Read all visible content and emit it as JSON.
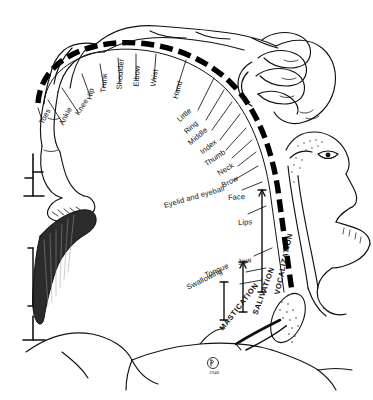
{
  "figure": {
    "background_color": "#ffffff",
    "ink_color": "#111111",
    "signature": {
      "monogram": "Ⓟ",
      "year": "1948"
    }
  },
  "body_labels": [
    {
      "id": "toes",
      "text": "Toes"
    },
    {
      "id": "ankle",
      "text": "Ankle"
    },
    {
      "id": "knee",
      "text": "Knee"
    },
    {
      "id": "hip",
      "text": "Hip"
    },
    {
      "id": "trunk",
      "text": "Trunk"
    },
    {
      "id": "shoulder",
      "text": "Shoulder"
    },
    {
      "id": "elbow",
      "text": "Elbow"
    },
    {
      "id": "wrist",
      "text": "Wrist"
    },
    {
      "id": "hand",
      "text": "Hand"
    },
    {
      "id": "little",
      "text": "Little"
    },
    {
      "id": "ring",
      "text": "Ring"
    },
    {
      "id": "middle",
      "text": "Middle"
    },
    {
      "id": "index",
      "text": "Index"
    },
    {
      "id": "thumb",
      "text": "Thumb"
    },
    {
      "id": "neck",
      "text": "Neck"
    },
    {
      "id": "brow",
      "text": "Brow"
    },
    {
      "id": "eyelid",
      "text": "Eyelid and eyeball"
    },
    {
      "id": "face",
      "text": "Face"
    },
    {
      "id": "lips",
      "text": "Lips"
    },
    {
      "id": "jaw",
      "text": "Jaw"
    },
    {
      "id": "tongue",
      "text": "Tongue"
    },
    {
      "id": "swallow",
      "text": "Swallowing"
    }
  ],
  "function_labels": [
    {
      "id": "vocalization",
      "text": "VOCALIZATION"
    },
    {
      "id": "salivation",
      "text": "SALIVATION"
    },
    {
      "id": "mastication",
      "text": "MASTICATION"
    }
  ]
}
